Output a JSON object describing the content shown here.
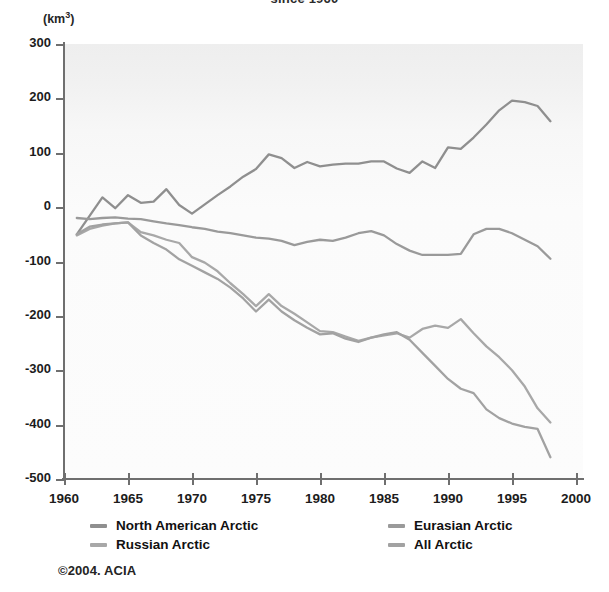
{
  "chart_title": "since 1960",
  "credit": "©2004. ACIA",
  "axis": {
    "y_unit": "(km",
    "y_unit_sup": "3",
    "y_unit_close": ")",
    "y_ticks": [
      "300",
      "200",
      "100",
      "0",
      "-100",
      "-200",
      "-300",
      "-400",
      "-500"
    ],
    "x_ticks": [
      "1960",
      "1965",
      "1970",
      "1975",
      "1980",
      "1985",
      "1990",
      "1995",
      "2000"
    ]
  },
  "legend": {
    "items": [
      {
        "label": "North American Arctic",
        "color": "#8f8f8f"
      },
      {
        "label": "Eurasian Arctic",
        "color": "#9a9a9a"
      },
      {
        "label": "Russian Arctic",
        "color": "#a8a8a8"
      },
      {
        "label": "All Arctic",
        "color": "#a2a2a2"
      }
    ]
  },
  "chart_data": {
    "type": "line",
    "title": "since 1960",
    "xlabel": "",
    "ylabel": "(km3)",
    "xlim": [
      1960,
      2000
    ],
    "ylim": [
      -500,
      300
    ],
    "grid": false,
    "legend_position": "bottom",
    "x": [
      1961,
      1962,
      1963,
      1964,
      1965,
      1966,
      1967,
      1968,
      1969,
      1970,
      1971,
      1972,
      1973,
      1974,
      1975,
      1976,
      1977,
      1978,
      1979,
      1980,
      1981,
      1982,
      1983,
      1984,
      1985,
      1986,
      1987,
      1988,
      1989,
      1990,
      1991,
      1992,
      1993,
      1994,
      1995,
      1996,
      1997,
      1998
    ],
    "series": [
      {
        "name": "North American Arctic",
        "color": "#8f8f8f",
        "values": [
          -50,
          -16,
          18,
          -2,
          22,
          8,
          10,
          33,
          4,
          -12,
          5,
          22,
          38,
          56,
          70,
          97,
          90,
          72,
          83,
          75,
          78,
          80,
          80,
          84,
          84,
          71,
          63,
          84,
          72,
          110,
          107,
          128,
          152,
          178,
          196,
          193,
          186,
          158
        ]
      },
      {
        "name": "Eurasian Arctic",
        "color": "#9a9a9a",
        "values": [
          -20,
          -22,
          -20,
          -19,
          -21,
          -22,
          -26,
          -30,
          -33,
          -37,
          -40,
          -45,
          -48,
          -52,
          -56,
          -58,
          -62,
          -70,
          -64,
          -60,
          -62,
          -56,
          -48,
          -44,
          -52,
          -68,
          -80,
          -88,
          -88,
          -88,
          -86,
          -50,
          -40,
          -40,
          -48,
          -60,
          -72,
          -95
        ]
      },
      {
        "name": "Russian Arctic",
        "color": "#a8a8a8",
        "values": [
          -52,
          -40,
          -34,
          -30,
          -28,
          -46,
          -52,
          -60,
          -66,
          -92,
          -102,
          -118,
          -140,
          -160,
          -182,
          -160,
          -182,
          -196,
          -212,
          -228,
          -230,
          -238,
          -246,
          -240,
          -236,
          -232,
          -240,
          -224,
          -218,
          -222,
          -206,
          -232,
          -256,
          -276,
          -300,
          -330,
          -370,
          -396
        ]
      },
      {
        "name": "All Arctic",
        "color": "#a2a2a2",
        "values": [
          -50,
          -36,
          -32,
          -30,
          -28,
          -52,
          -66,
          -78,
          -96,
          -108,
          -120,
          -132,
          -148,
          -168,
          -192,
          -170,
          -192,
          -208,
          -222,
          -234,
          -232,
          -242,
          -248,
          -240,
          -234,
          -230,
          -244,
          -268,
          -292,
          -316,
          -334,
          -342,
          -372,
          -388,
          -398,
          -404,
          -408,
          -460
        ]
      }
    ]
  }
}
